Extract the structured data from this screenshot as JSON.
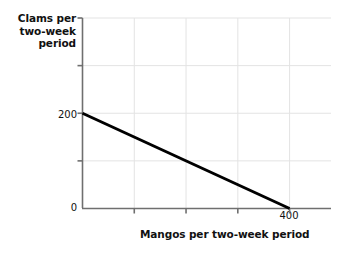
{
  "chart_data": {
    "type": "line",
    "title": "",
    "subtitle": "",
    "xlabel": "Mangos per two-week period",
    "ylabel": "Clams per two-week period",
    "xlim": [
      0,
      480
    ],
    "ylim": [
      0,
      400
    ],
    "grid": true,
    "legend": null,
    "x_tick_labels": [
      "0",
      "400"
    ],
    "x_tick_values": [
      0,
      400
    ],
    "y_tick_labels": [
      "0",
      "200"
    ],
    "y_tick_values": [
      0,
      200
    ],
    "x_gridline_values": [
      100,
      200,
      300,
      400
    ],
    "y_gridline_values": [
      100,
      200,
      300,
      400
    ],
    "series": [
      {
        "name": "Production possibilities frontier",
        "color": "#000000",
        "linewidth": 3,
        "x": [
          0,
          400
        ],
        "values": [
          200,
          0
        ],
        "points": [
          {
            "x": 0,
            "y": 200
          },
          {
            "x": 400,
            "y": 0
          }
        ]
      }
    ],
    "annotations": []
  },
  "axes": {
    "y_title_line1": "Clams per two-",
    "y_title_line2": "week period",
    "y_title": "Clams per two-week period",
    "x_title": "Mangos per two-week period",
    "y_tick_200": "200",
    "y_tick_0": "0",
    "x_tick_400": "400"
  },
  "colors": {
    "axis": "#6f6f6f",
    "grid": "#e3e3e3",
    "line": "#000000",
    "text": "#111111",
    "background": "#ffffff"
  }
}
